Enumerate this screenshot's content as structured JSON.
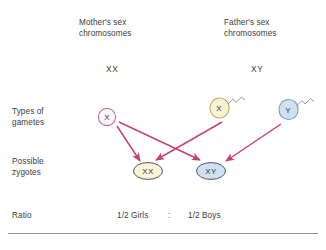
{
  "diagram": {
    "title_semantic": "human-sex-determination-punnett-cross",
    "background_color": "#ffffff",
    "arrow_color": "#c8436b",
    "rule_color": "#8e9099"
  },
  "headers": {
    "mother": "Mother's sex\nchromosomes",
    "father": "Father's sex\nchromosomes"
  },
  "parent_genotypes": {
    "mother": "XX",
    "father": "XY"
  },
  "row_labels": {
    "gametes": "Types of\ngametes",
    "zygotes": "Possible\nzygotes",
    "ratio": "Ratio"
  },
  "gametes": [
    {
      "id": "egg-x",
      "label": "X",
      "kind": "egg",
      "fill": "#fdf7fa",
      "stroke": "#c96f94"
    },
    {
      "id": "sperm-x",
      "label": "X",
      "kind": "sperm",
      "fill": "#f7f2cf",
      "stroke": "#b8ae6b"
    },
    {
      "id": "sperm-y",
      "label": "Y",
      "kind": "sperm",
      "fill": "#cfe1f2",
      "stroke": "#7c9dc0"
    }
  ],
  "zygotes": [
    {
      "id": "zygote-xx",
      "label": "XX",
      "fill": "#f9f4da",
      "stroke": "#56554f"
    },
    {
      "id": "zygote-xy",
      "label": "XY",
      "fill": "#cfe1f2",
      "stroke": "#4f5a66"
    }
  ],
  "crosses": [
    {
      "from": "egg-x",
      "to": "zygote-xx"
    },
    {
      "from": "egg-x",
      "to": "zygote-xy"
    },
    {
      "from": "sperm-x",
      "to": "zygote-xx"
    },
    {
      "from": "sperm-y",
      "to": "zygote-xy"
    }
  ],
  "ratio": {
    "girls": "1/2 Girls",
    "separator": ":",
    "boys": "1/2 Boys"
  }
}
